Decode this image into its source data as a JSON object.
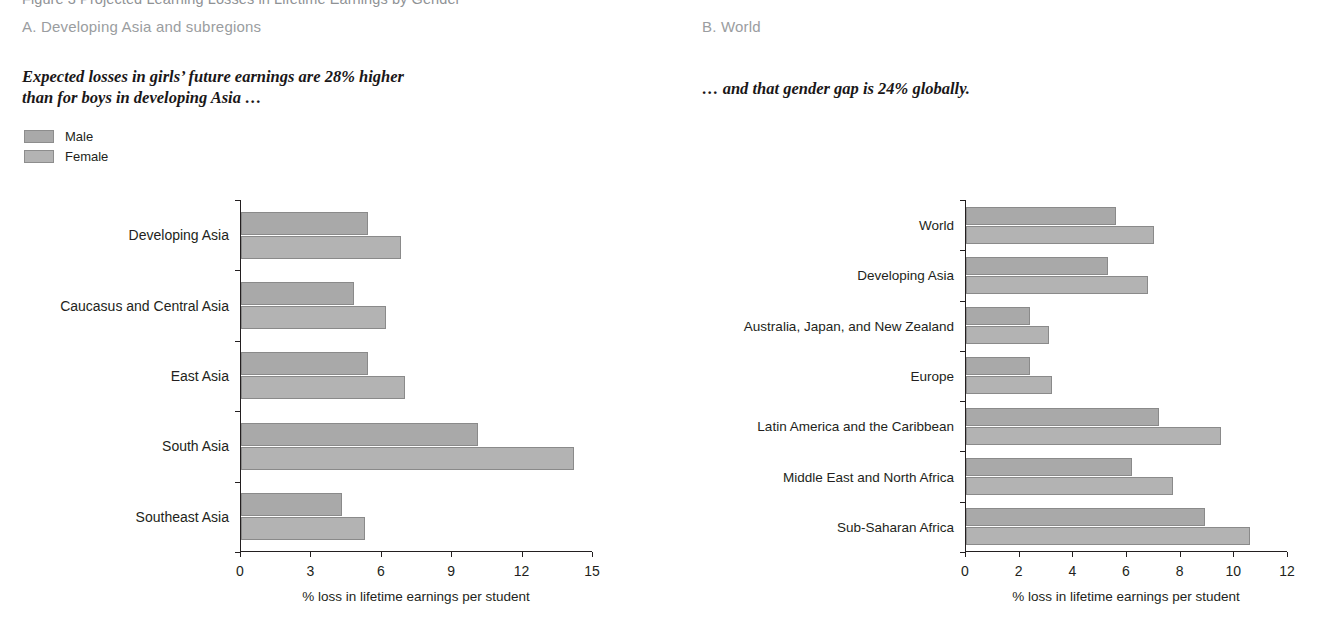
{
  "figure": {
    "title": "Figure 3 Projected Learning Losses in Lifetime Earnings by Gender"
  },
  "colors": {
    "male": "#a9a9a9",
    "female": "#b3b3b3",
    "bar_border": "#8a8a8a",
    "axis": "#231f20",
    "panel_label": "#9a9da0"
  },
  "legend": {
    "items": [
      {
        "label": "Male",
        "color": "#a9a9a9"
      },
      {
        "label": "Female",
        "color": "#b3b3b3"
      }
    ]
  },
  "panels": [
    {
      "label": "A. Developing Asia and subregions",
      "subtitle": "Expected losses in girls’ future earnings are 28% higher\nthan for boys in developing Asia …"
    },
    {
      "label": "B. World",
      "subtitle": "… and that gender gap is 24% globally."
    }
  ],
  "chart_data": [
    {
      "type": "bar",
      "orientation": "horizontal",
      "title": "A. Developing Asia and subregions",
      "categories": [
        "Developing Asia",
        "Caucasus and Central Asia",
        "East Asia",
        "South Asia",
        "Southeast Asia"
      ],
      "series": [
        {
          "name": "Male",
          "values": [
            5.4,
            4.8,
            5.4,
            10.1,
            4.3
          ]
        },
        {
          "name": "Female",
          "values": [
            6.8,
            6.2,
            7.0,
            14.2,
            5.3
          ]
        }
      ],
      "xlabel": "% loss in lifetime earnings per student",
      "ylabel": "",
      "xlim": [
        0,
        15
      ],
      "xticks": [
        0,
        3,
        6,
        9,
        12,
        15
      ],
      "grid": false,
      "legend_position": "top-left"
    },
    {
      "type": "bar",
      "orientation": "horizontal",
      "title": "B. World",
      "categories": [
        "World",
        "Developing Asia",
        "Australia, Japan, and New Zealand",
        "Europe",
        "Latin America and the Caribbean",
        "Middle East and North Africa",
        "Sub-Saharan Africa"
      ],
      "series": [
        {
          "name": "Male",
          "values": [
            5.6,
            5.3,
            2.4,
            2.4,
            7.2,
            6.2,
            8.9
          ]
        },
        {
          "name": "Female",
          "values": [
            7.0,
            6.8,
            3.1,
            3.2,
            9.5,
            7.7,
            10.6
          ]
        }
      ],
      "xlabel": "% loss in lifetime earnings per student",
      "ylabel": "",
      "xlim": [
        0,
        12
      ],
      "xticks": [
        0,
        2,
        4,
        6,
        8,
        10,
        12
      ],
      "grid": false,
      "legend_position": "none"
    }
  ]
}
